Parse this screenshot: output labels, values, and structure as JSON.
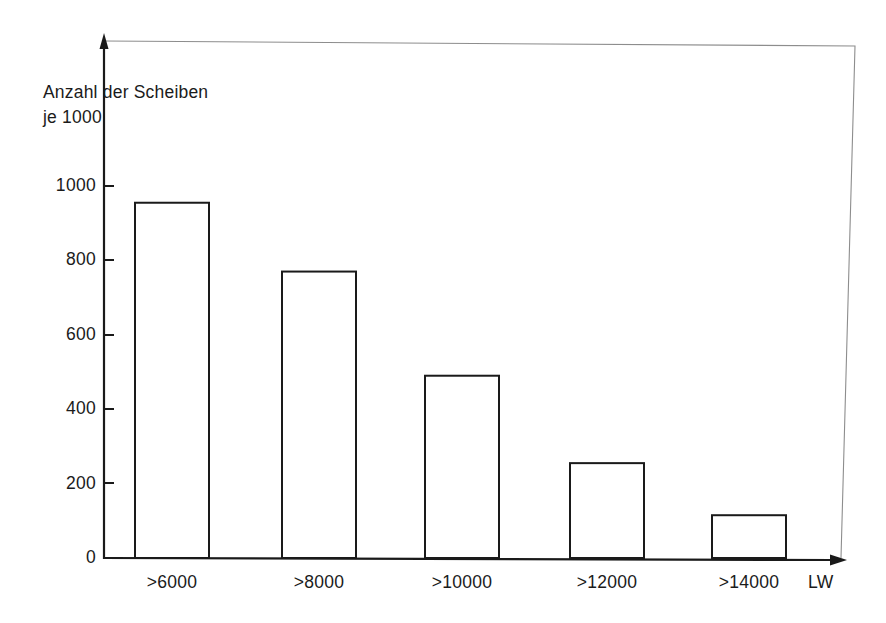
{
  "figure": {
    "y_axis_caption_line1": "Anzahl der Scheiben",
    "y_axis_caption_line2": "je 1000",
    "x_axis_unit": "LW",
    "arrow_head": "arrow-head-icon",
    "frame": "scan-frame"
  },
  "chart_data": {
    "type": "bar",
    "title": "",
    "subtitle": "",
    "xlabel": "LW",
    "ylabel": "Anzahl der Scheiben je 1000",
    "categories": [
      ">6000",
      ">8000",
      ">10000",
      ">12000",
      ">14000"
    ],
    "values": [
      955,
      770,
      490,
      255,
      115
    ],
    "ylim": [
      0,
      1000
    ],
    "yticks": [
      0,
      200,
      400,
      600,
      800,
      1000
    ],
    "ytick_labels": [
      "0",
      "200",
      "400",
      "600",
      "800",
      "1000"
    ],
    "grid": false,
    "legend": null,
    "bar_style": {
      "fill": "#ffffff",
      "stroke": "#1a1a1a",
      "stroke_width": 2
    },
    "axis_color": "#1a1a1a"
  }
}
